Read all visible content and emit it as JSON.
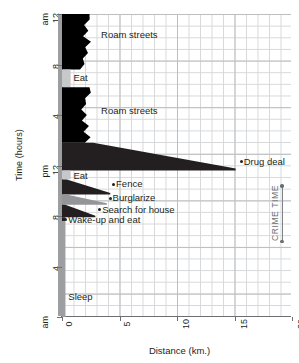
{
  "chart_data": {
    "type": "area",
    "title": "",
    "xlabel": "Distance (km.)",
    "ylabel": "Time (hours)",
    "xlim": [
      0,
      20
    ],
    "ylim_hours": [
      0,
      24
    ],
    "xticks": [
      "0",
      "5",
      "10",
      "15",
      "20"
    ],
    "xtick_values": [
      0,
      5,
      10,
      15,
      20
    ],
    "yticks": [
      {
        "label": "12",
        "sub": "am",
        "hour": 24
      },
      {
        "label": "8",
        "sub": "",
        "hour": 20
      },
      {
        "label": "4",
        "sub": "",
        "hour": 16
      },
      {
        "label": "12",
        "sub": "pm",
        "hour": 12
      },
      {
        "label": "8",
        "sub": "",
        "hour": 8
      },
      {
        "label": "4",
        "sub": "",
        "hour": 4
      },
      {
        "label": "",
        "sub": "am",
        "hour": 0
      }
    ],
    "grid": "on",
    "legend": "none",
    "annotations": [
      {
        "name": "crime-time",
        "text": "CRIME TIME",
        "hour_start": 10.4,
        "hour_end": 6.0
      }
    ],
    "activities": [
      {
        "name": "roam-streets-night",
        "label": "Roam streets",
        "hour_start": 24.0,
        "hour_end": 19.6,
        "distance_max": 2.6,
        "fill": "#000000",
        "label_x": 3.4,
        "label_hour": 22.3
      },
      {
        "name": "eat-morning",
        "label": "Eat",
        "hour_start": 19.6,
        "hour_end": 18.2,
        "distance_max": 0.75,
        "fill": "#c7c8ca",
        "label_x": 1.0,
        "label_hour": 18.9
      },
      {
        "name": "roam-streets-day",
        "label": "Roam streets",
        "hour_start": 18.2,
        "hour_end": 13.8,
        "distance_max": 2.6,
        "fill": "#000000",
        "label_x": 3.4,
        "label_hour": 16.3
      },
      {
        "name": "drug-deal",
        "label": "Drug deal",
        "hour_start": 13.8,
        "hour_end": 11.6,
        "distance_max": 15.1,
        "fill": "#231f20",
        "label_x": 15.8,
        "label_hour": 12.3
      },
      {
        "name": "eat-afternoon",
        "label": "Eat",
        "hour_start": 11.6,
        "hour_end": 10.9,
        "distance_max": 0.75,
        "fill": "#c7c8ca",
        "label_x": 1.0,
        "label_hour": 11.2
      },
      {
        "name": "fence",
        "label": "Fence",
        "hour_start": 10.9,
        "hour_end": 9.7,
        "distance_max": 4.2,
        "fill": "#231f20",
        "label_x": 4.7,
        "label_hour": 10.5
      },
      {
        "name": "burglarize",
        "label": "Burglarize",
        "hour_start": 9.7,
        "hour_end": 8.9,
        "distance_max": 3.9,
        "fill": "#939598",
        "label_x": 4.4,
        "label_hour": 9.4
      },
      {
        "name": "search-for-house",
        "label": "Search for house",
        "hour_start": 8.9,
        "hour_end": 7.9,
        "distance_max": 2.9,
        "fill": "#231f20",
        "label_x": 3.5,
        "label_hour": 8.5
      },
      {
        "name": "wake-up-and-eat",
        "label": "Wake-up and eat",
        "hour_start": 7.9,
        "hour_end": 7.6,
        "distance_max": 0.3,
        "fill": "#231f20",
        "label_x": 0.55,
        "label_hour": 7.7
      },
      {
        "name": "sleep",
        "label": "Sleep",
        "hour_start": 7.6,
        "hour_end": 0.0,
        "distance_max": 0.3,
        "fill": "#9c9ea1",
        "label_x": 0.55,
        "label_hour": 1.6
      }
    ]
  },
  "axes": {
    "y_title": "Time (hours)",
    "x_title": "Distance (km.)"
  },
  "labels": {
    "roam_streets_1": "Roam streets",
    "eat_1": "Eat",
    "roam_streets_2": "Roam streets",
    "drug_deal": "Drug deal",
    "eat_2": "Eat",
    "fence": "Fence",
    "burglarize": "Burglarize",
    "search_for_house": "Search for house",
    "wake_up_and_eat": "Wake-up and eat",
    "sleep": "Sleep",
    "crime_time": "CRIME TIME"
  },
  "colors": {
    "dark": "#000000",
    "mid_gray": "#939598",
    "light_gray": "#c7c8ca",
    "home_band": "#9c9ea1",
    "grid_minor": "#d7d8da",
    "grid_major": "#bcbec0",
    "axis": "#6d6e71",
    "text": "#231f20",
    "annotation": "#6d6e71"
  }
}
